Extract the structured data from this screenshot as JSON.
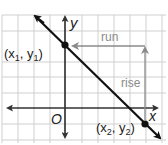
{
  "diagram": {
    "title": "",
    "axes": {
      "x_label": "x",
      "y_label": "y",
      "origin_label": "O"
    },
    "points": [
      {
        "label_main": "(x",
        "sub1": "1",
        "mid": ", y",
        "sub2": "1",
        "end": ")"
      },
      {
        "label_main": "(x",
        "sub1": "2",
        "mid": ", y",
        "sub2": "2",
        "end": ")"
      }
    ],
    "annotations": {
      "run": "run",
      "rise": "rise"
    },
    "colors": {
      "grid": "#c8c8c8",
      "axis": "#333333",
      "line": "#111111",
      "annotation": "#8a8a8a"
    }
  }
}
